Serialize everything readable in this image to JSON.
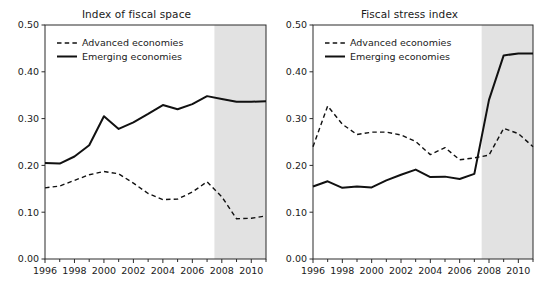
{
  "figure": {
    "background_color": "#ffffff",
    "shade_color": "#e2e2e2",
    "line_color": "#111111"
  },
  "chart_data": [
    {
      "type": "line",
      "title": "Index of fiscal space",
      "xlabel": "",
      "ylabel": "",
      "xlim": [
        1996,
        2011
      ],
      "ylim": [
        0.0,
        0.5
      ],
      "grid": false,
      "legend_position": "top-left",
      "ytick_labels": [
        "0.00",
        "0.10",
        "0.20",
        "0.30",
        "0.40",
        "0.50"
      ],
      "ytick_values": [
        0.0,
        0.1,
        0.2,
        0.3,
        0.4,
        0.5
      ],
      "xtick_labels": [
        "1996",
        "1998",
        "2000",
        "2002",
        "2004",
        "2006",
        "2008",
        "2010"
      ],
      "xtick_values": [
        1996,
        1998,
        2000,
        2002,
        2004,
        2006,
        2008,
        2010
      ],
      "xminor_values": [
        1997,
        1999,
        2001,
        2003,
        2005,
        2007,
        2009,
        2011
      ],
      "shaded_region": {
        "start": 2007.5,
        "end": 2011,
        "label": "projection"
      },
      "x": [
        1996,
        1997,
        1998,
        1999,
        2000,
        2001,
        2002,
        2003,
        2004,
        2005,
        2006,
        2007,
        2008,
        2009,
        2010,
        2011
      ],
      "series": [
        {
          "name": "Advanced economies",
          "style": "dashed",
          "values": [
            0.152,
            0.156,
            0.168,
            0.18,
            0.187,
            0.182,
            0.162,
            0.14,
            0.127,
            0.128,
            0.143,
            0.165,
            0.133,
            0.086,
            0.087,
            0.092
          ]
        },
        {
          "name": "Emerging economies",
          "style": "solid",
          "values": [
            0.205,
            0.204,
            0.219,
            0.243,
            0.305,
            0.278,
            0.292,
            0.31,
            0.329,
            0.32,
            0.331,
            0.348,
            0.342,
            0.336,
            0.336,
            0.337
          ]
        }
      ]
    },
    {
      "type": "line",
      "title": "Fiscal stress index",
      "xlabel": "",
      "ylabel": "",
      "xlim": [
        1996,
        2011
      ],
      "ylim": [
        0.0,
        0.5
      ],
      "grid": false,
      "legend_position": "top-left",
      "ytick_labels": [
        "0.00",
        "0.10",
        "0.20",
        "0.30",
        "0.40",
        "0.50"
      ],
      "ytick_values": [
        0.0,
        0.1,
        0.2,
        0.3,
        0.4,
        0.5
      ],
      "xtick_labels": [
        "1996",
        "1998",
        "2000",
        "2002",
        "2004",
        "2006",
        "2008",
        "2010"
      ],
      "xtick_values": [
        1996,
        1998,
        2000,
        2002,
        2004,
        2006,
        2008,
        2010
      ],
      "xminor_values": [
        1997,
        1999,
        2001,
        2003,
        2005,
        2007,
        2009,
        2011
      ],
      "shaded_region": {
        "start": 2007.5,
        "end": 2011,
        "label": "projection"
      },
      "x": [
        1996,
        1997,
        1998,
        1999,
        2000,
        2001,
        2002,
        2003,
        2004,
        2005,
        2006,
        2007,
        2008,
        2009,
        2010,
        2011
      ],
      "series": [
        {
          "name": "Advanced economies",
          "style": "dashed",
          "values": [
            0.24,
            0.327,
            0.288,
            0.266,
            0.271,
            0.271,
            0.265,
            0.251,
            0.223,
            0.238,
            0.212,
            0.216,
            0.222,
            0.279,
            0.268,
            0.24
          ]
        },
        {
          "name": "Emerging economies",
          "style": "solid",
          "values": [
            0.155,
            0.166,
            0.152,
            0.155,
            0.153,
            0.168,
            0.18,
            0.191,
            0.175,
            0.176,
            0.171,
            0.182,
            0.34,
            0.435,
            0.439,
            0.439
          ]
        }
      ]
    }
  ]
}
